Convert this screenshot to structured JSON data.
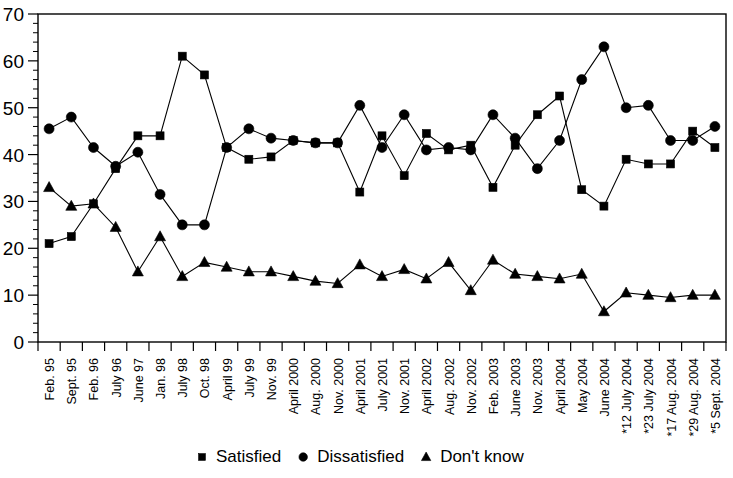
{
  "chart_data": {
    "type": "line",
    "title": "",
    "xlabel": "",
    "ylabel": "",
    "ylim": [
      0,
      70
    ],
    "ytick_step": 10,
    "yminor_step": 2,
    "grid": false,
    "legend_position": "bottom",
    "categories": [
      "Feb. 95",
      "Sept. 95",
      "Feb. 96",
      "July 96",
      "June 97",
      "Jan. 98",
      "July 98",
      "Oct. 98",
      "April 99",
      "July 99",
      "Nov. 99",
      "April 2000",
      "Aug. 2000",
      "Nov. 2000",
      "April 2001",
      "July 2001",
      "Nov. 2001",
      "April 2002",
      "Aug. 2002",
      "Nov. 2002",
      "Feb. 2003",
      "June 2003",
      "Nov. 2003",
      "April 2004",
      "May 2004",
      "June 2004",
      "*12 July 2004",
      "*23 July 2004",
      "*17 Aug. 2004",
      "*29 Aug. 2004",
      "*5 Sept. 2004"
    ],
    "ytick_labels": [
      "0",
      "10",
      "20",
      "30",
      "40",
      "50",
      "60",
      "70"
    ],
    "series": [
      {
        "name": "Satisfied",
        "marker": "square",
        "values": [
          21,
          22.5,
          29.5,
          37,
          44,
          44,
          61,
          57,
          41.5,
          39,
          39.5,
          43,
          42.5,
          42.5,
          32,
          44,
          35.5,
          44.5,
          41,
          42,
          33,
          42,
          48.5,
          52.5,
          32.5,
          29,
          39,
          38,
          38,
          45,
          41.5
        ]
      },
      {
        "name": "Dissatisfied",
        "marker": "circle",
        "values": [
          45.5,
          48,
          41.5,
          37.5,
          40.5,
          31.5,
          25,
          25,
          41.5,
          45.5,
          43.5,
          43,
          42.5,
          42.5,
          50.5,
          41.5,
          48.5,
          41,
          41.5,
          41,
          48.5,
          43.5,
          37,
          43,
          56,
          63,
          50,
          50.5,
          43,
          43,
          46
        ]
      },
      {
        "name": "Don't know",
        "marker": "triangle",
        "values": [
          33,
          29,
          29.5,
          24.5,
          15,
          22.5,
          14,
          17,
          16,
          15,
          15,
          14,
          13,
          12.5,
          16.5,
          14,
          15.5,
          13.5,
          17,
          11,
          17.5,
          14.5,
          14,
          13.5,
          14.5,
          6.5,
          10.5,
          10,
          9.5,
          10,
          10
        ]
      }
    ]
  },
  "legend": {
    "items": [
      {
        "label": "Satisfied",
        "marker": "square"
      },
      {
        "label": "Dissatisfied",
        "marker": "circle"
      },
      {
        "label": "Don't know",
        "marker": "triangle"
      }
    ]
  }
}
